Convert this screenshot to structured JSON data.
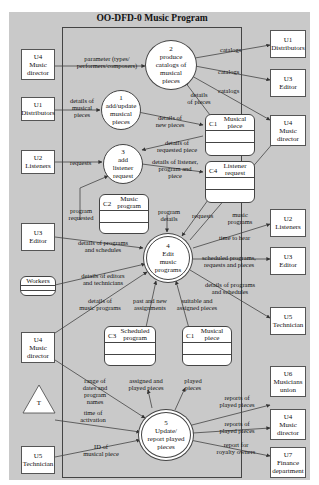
{
  "diagram": {
    "title": "OO-DFD-0  Music Program",
    "colors": {
      "background": "#c9c9c9",
      "node_fill": "#ffffff",
      "stroke": "#444444"
    },
    "external_entities": [
      {
        "id": "U4",
        "name": "Music director",
        "l1": "U4",
        "l2": "Music",
        "l3": "director"
      },
      {
        "id": "U1",
        "name": "Distributors",
        "l1": "U1",
        "l2": "Distributors"
      },
      {
        "id": "U2",
        "name": "Listeners",
        "l1": "U2",
        "l2": "Listeners"
      },
      {
        "id": "U3",
        "name": "Editor",
        "l1": "U3",
        "l2": "Editor"
      },
      {
        "id": "Workers",
        "name": "Workers",
        "l1": "Workers"
      },
      {
        "id": "U4b",
        "name": "Music director",
        "l1": "U4",
        "l2": "Music",
        "l3": "director"
      },
      {
        "id": "T",
        "name": "Time",
        "l1": "T"
      },
      {
        "id": "U5",
        "name": "Technician",
        "l1": "U5",
        "l2": "Technician"
      },
      {
        "id": "U1r",
        "name": "Distributors",
        "l1": "U1",
        "l2": "Distributors"
      },
      {
        "id": "U3r",
        "name": "Editor",
        "l1": "U3",
        "l2": "Editor"
      },
      {
        "id": "U4r",
        "name": "Music director",
        "l1": "U4",
        "l2": "Music",
        "l3": "director"
      },
      {
        "id": "U2r",
        "name": "Listeners",
        "l1": "U2",
        "l2": "Listeners"
      },
      {
        "id": "U3r2",
        "name": "Editor",
        "l1": "U3",
        "l2": "Editor"
      },
      {
        "id": "U5r",
        "name": "Technician",
        "l1": "U5",
        "l2": "Technician"
      },
      {
        "id": "U6",
        "name": "Musicians union",
        "l1": "U6",
        "l2": "Musicians",
        "l3": "union"
      },
      {
        "id": "U4r2",
        "name": "Music director",
        "l1": "U4",
        "l2": "Music",
        "l3": "director"
      },
      {
        "id": "U7",
        "name": "Finance department",
        "l1": "U7",
        "l2": "Finance",
        "l3": "department"
      }
    ],
    "processes": [
      {
        "num": "1",
        "l1": "add/update",
        "l2": "musical",
        "l3": "pieces"
      },
      {
        "num": "2",
        "l1": "produce",
        "l2": "catalogs of",
        "l3": "musical",
        "l4": "pieces"
      },
      {
        "num": "3",
        "l1": "add",
        "l2": "listener",
        "l3": "request"
      },
      {
        "num": "4",
        "l1": "Edit",
        "l2": "music",
        "l3": "programs"
      },
      {
        "num": "5",
        "l1": "Update/",
        "l2": "report played",
        "l3": "pieces"
      }
    ],
    "data_stores": [
      {
        "id": "C1",
        "name": "Musical piece",
        "l1": "Musical",
        "l2": "piece"
      },
      {
        "id": "C4",
        "name": "Listener request",
        "l1": "Listener",
        "l2": "request"
      },
      {
        "id": "C2",
        "name": "Music program",
        "l1": "Music",
        "l2": "program"
      },
      {
        "id": "C3",
        "name": "Scheduled program",
        "l1": "Scheduled",
        "l2": "program"
      },
      {
        "id": "C1b",
        "name": "Musical piece",
        "l1": "Musical",
        "l2": "piece",
        "idlabel": "C1"
      }
    ],
    "flows": [
      {
        "l1": "parameter (types/",
        "l2": "performers/composers)"
      },
      {
        "l1": "catalogs"
      },
      {
        "l1": "catalogs"
      },
      {
        "l1": "catalogs"
      },
      {
        "l1": "details of",
        "l2": "musical",
        "l3": "pieces"
      },
      {
        "l1": "details",
        "l2": "of pieces"
      },
      {
        "l1": "details of",
        "l2": "new pieces"
      },
      {
        "l1": "details of",
        "l2": "requested piece"
      },
      {
        "l1": "requests"
      },
      {
        "l1": "details of listener,",
        "l2": "program and",
        "l3": "piece"
      },
      {
        "l1": "program",
        "l2": "requested"
      },
      {
        "l1": "program",
        "l2": "details"
      },
      {
        "l1": "requests"
      },
      {
        "l1": "music",
        "l2": "programs"
      },
      {
        "l1": "time to hear"
      },
      {
        "l1": "details of programs",
        "l2": "and schedules"
      },
      {
        "l1": "scheduled programs,",
        "l2": "requests and pieces"
      },
      {
        "l1": "details of editors",
        "l2": "and technicians"
      },
      {
        "l1": "details of programs",
        "l2": "and schedules"
      },
      {
        "l1": "details of",
        "l2": "music programs"
      },
      {
        "l1": "past and new",
        "l2": "assignments"
      },
      {
        "l1": "suitable and",
        "l2": "assigned pieces"
      },
      {
        "l1": "range of",
        "l2": "dates and",
        "l3": "program",
        "l4": "names"
      },
      {
        "l1": "assigned and",
        "l2": "played pieces"
      },
      {
        "l1": "played",
        "l2": "pieces"
      },
      {
        "l1": "time of",
        "l2": "activation"
      },
      {
        "l1": "reports of",
        "l2": "played pieces"
      },
      {
        "l1": "reports of",
        "l2": "played pieces"
      },
      {
        "l1": "ID of",
        "l2": "musical piece"
      },
      {
        "l1": "report for",
        "l2": "royalty owners"
      }
    ]
  }
}
